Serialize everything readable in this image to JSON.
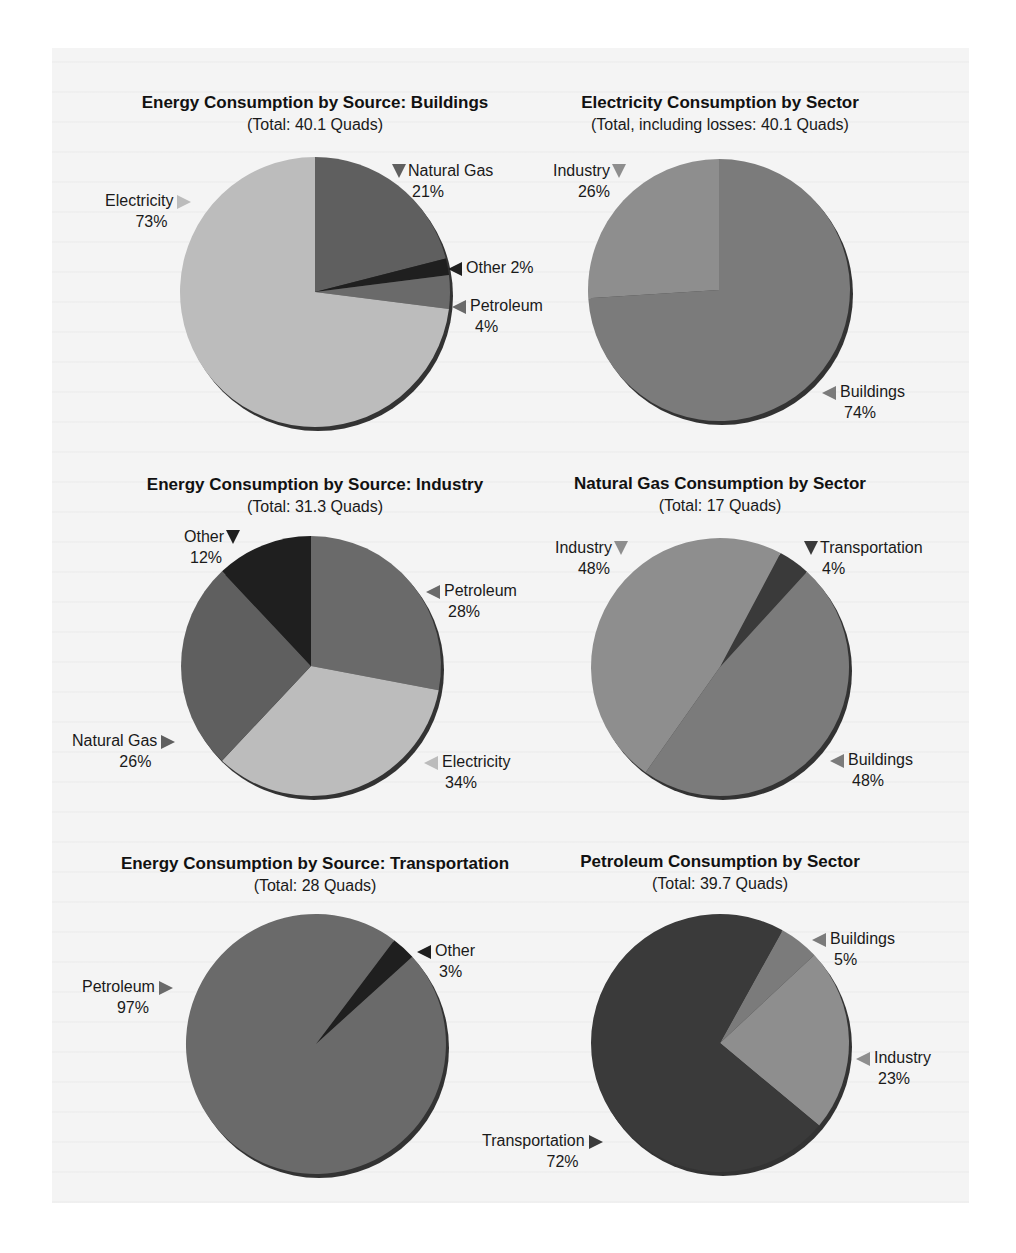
{
  "colors": {
    "light": "#b9b9b9",
    "medium": "#7b7b7b",
    "mediumdark": "#5f5f5f",
    "dark": "#3a3a3a",
    "darkest": "#1f1f1f",
    "background_panel": "#f4f4f4"
  },
  "chart_data": [
    {
      "type": "pie",
      "title": "Energy Consumption by Source: Buildings",
      "subtitle": "(Total: 40.1 Quads)",
      "total_quads": 40.1,
      "categories": [
        "Natural Gas",
        "Other",
        "Petroleum",
        "Electricity"
      ],
      "values": [
        21,
        2,
        4,
        73
      ],
      "unit": "%"
    },
    {
      "type": "pie",
      "title": "Electricity Consumption by Sector",
      "subtitle": "(Total, including losses: 40.1 Quads)",
      "total_quads": 40.1,
      "categories": [
        "Buildings",
        "Industry"
      ],
      "values": [
        74,
        26
      ],
      "unit": "%"
    },
    {
      "type": "pie",
      "title": "Energy Consumption by Source: Industry",
      "subtitle": "(Total: 31.3 Quads)",
      "total_quads": 31.3,
      "categories": [
        "Petroleum",
        "Electricity",
        "Natural Gas",
        "Other"
      ],
      "values": [
        28,
        34,
        26,
        12
      ],
      "unit": "%"
    },
    {
      "type": "pie",
      "title": "Natural Gas Consumption by Sector",
      "subtitle": "(Total: 17 Quads)",
      "total_quads": 17,
      "categories": [
        "Transportation",
        "Buildings",
        "Industry"
      ],
      "values": [
        4,
        48,
        48
      ],
      "unit": "%"
    },
    {
      "type": "pie",
      "title": "Energy Consumption by Source: Transportation",
      "subtitle": "(Total: 28 Quads)",
      "total_quads": 28,
      "categories": [
        "Other",
        "Petroleum"
      ],
      "values": [
        3,
        97
      ],
      "unit": "%"
    },
    {
      "type": "pie",
      "title": "Petroleum Consumption by Sector",
      "subtitle": "(Total: 39.7 Quads)",
      "total_quads": 39.7,
      "categories": [
        "Buildings",
        "Industry",
        "Transportation"
      ],
      "values": [
        5,
        23,
        72
      ],
      "unit": "%"
    }
  ],
  "charts": [
    {
      "id": "buildings-source",
      "title": "Energy Consumption by Source: Buildings",
      "subtitle": "(Total: 40.1 Quads)",
      "start_deg": 0,
      "slices": [
        {
          "name": "Natural Gas",
          "pct": "21%",
          "value": 21,
          "color": "#5f5f5f"
        },
        {
          "name": "Other",
          "pct": "2%",
          "value": 2,
          "color": "#1f1f1f"
        },
        {
          "name": "Petroleum",
          "pct": "4%",
          "value": 4,
          "color": "#6a6a6a"
        },
        {
          "name": "Electricity",
          "pct": "73%",
          "value": 73,
          "color": "#bcbcbc"
        }
      ],
      "labels": [
        {
          "name": "Natural Gas",
          "pct": "21%",
          "arrow": "down",
          "arrow_color": "#5f5f5f"
        },
        {
          "name": "Other 2%",
          "pct": "",
          "arrow": "left",
          "arrow_color": "#1f1f1f"
        },
        {
          "name": "Petroleum",
          "pct": "4%",
          "arrow": "left",
          "arrow_color": "#6a6a6a"
        },
        {
          "name": "Electricity",
          "pct": "73%",
          "arrow": "right",
          "arrow_color": "#bcbcbc"
        }
      ]
    },
    {
      "id": "electricity-sector",
      "title": "Electricity Consumption by Sector",
      "subtitle": "(Total, including losses: 40.1 Quads)",
      "start_deg": 0,
      "slices": [
        {
          "name": "Buildings",
          "pct": "74%",
          "value": 74,
          "color": "#7b7b7b"
        },
        {
          "name": "Industry",
          "pct": "26%",
          "value": 26,
          "color": "#8e8e8e"
        }
      ],
      "labels": [
        {
          "name": "Industry",
          "pct": "26%",
          "arrow": "down",
          "arrow_color": "#8e8e8e"
        },
        {
          "name": "Buildings",
          "pct": "74%",
          "arrow": "left",
          "arrow_color": "#7b7b7b"
        }
      ]
    },
    {
      "id": "industry-source",
      "title": "Energy Consumption by Source: Industry",
      "subtitle": "(Total: 31.3 Quads)",
      "start_deg": 0,
      "slices": [
        {
          "name": "Petroleum",
          "pct": "28%",
          "value": 28,
          "color": "#6a6a6a"
        },
        {
          "name": "Electricity",
          "pct": "34%",
          "value": 34,
          "color": "#bcbcbc"
        },
        {
          "name": "Natural Gas",
          "pct": "26%",
          "value": 26,
          "color": "#5f5f5f"
        },
        {
          "name": "Other",
          "pct": "12%",
          "value": 12,
          "color": "#1f1f1f"
        }
      ],
      "labels": [
        {
          "name": "Other",
          "pct": "12%",
          "arrow": "down",
          "arrow_color": "#1f1f1f"
        },
        {
          "name": "Petroleum",
          "pct": "28%",
          "arrow": "left",
          "arrow_color": "#6a6a6a"
        },
        {
          "name": "Natural Gas",
          "pct": "26%",
          "arrow": "right",
          "arrow_color": "#5f5f5f"
        },
        {
          "name": "Electricity",
          "pct": "34%",
          "arrow": "left",
          "arrow_color": "#bcbcbc"
        }
      ]
    },
    {
      "id": "natural-gas-sector",
      "title": "Natural Gas Consumption by Sector",
      "subtitle": "(Total: 17 Quads)",
      "start_deg": 28,
      "slices": [
        {
          "name": "Transportation",
          "pct": "4%",
          "value": 4,
          "color": "#3a3a3a"
        },
        {
          "name": "Buildings",
          "pct": "48%",
          "value": 48,
          "color": "#7b7b7b"
        },
        {
          "name": "Industry",
          "pct": "48%",
          "value": 48,
          "color": "#8e8e8e"
        }
      ],
      "labels": [
        {
          "name": "Industry",
          "pct": "48%",
          "arrow": "down",
          "arrow_color": "#8e8e8e"
        },
        {
          "name": "Transportation",
          "pct": "4%",
          "arrow": "down",
          "arrow_color": "#3a3a3a"
        },
        {
          "name": "Buildings",
          "pct": "48%",
          "arrow": "left",
          "arrow_color": "#7b7b7b"
        }
      ]
    },
    {
      "id": "transportation-source",
      "title": "Energy Consumption by Source: Transportation",
      "subtitle": "(Total: 28 Quads)",
      "start_deg": 37,
      "slices": [
        {
          "name": "Other",
          "pct": "3%",
          "value": 3,
          "color": "#1f1f1f"
        },
        {
          "name": "Petroleum",
          "pct": "97%",
          "value": 97,
          "color": "#6a6a6a"
        }
      ],
      "labels": [
        {
          "name": "Other",
          "pct": "3%",
          "arrow": "left",
          "arrow_color": "#1f1f1f"
        },
        {
          "name": "Petroleum",
          "pct": "97%",
          "arrow": "right",
          "arrow_color": "#6a6a6a"
        }
      ]
    },
    {
      "id": "petroleum-sector",
      "title": "Petroleum Consumption by Sector",
      "subtitle": "(Total: 39.7 Quads)",
      "start_deg": 29,
      "slices": [
        {
          "name": "Buildings",
          "pct": "5%",
          "value": 5,
          "color": "#7b7b7b"
        },
        {
          "name": "Industry",
          "pct": "23%",
          "value": 23,
          "color": "#8e8e8e"
        },
        {
          "name": "Transportation",
          "pct": "72%",
          "value": 72,
          "color": "#3a3a3a"
        }
      ],
      "labels": [
        {
          "name": "Buildings",
          "pct": "5%",
          "arrow": "left",
          "arrow_color": "#7b7b7b"
        },
        {
          "name": "Industry",
          "pct": "23%",
          "arrow": "left",
          "arrow_color": "#8e8e8e"
        },
        {
          "name": "Transportation",
          "pct": "72%",
          "arrow": "right",
          "arrow_color": "#3a3a3a"
        }
      ]
    }
  ]
}
